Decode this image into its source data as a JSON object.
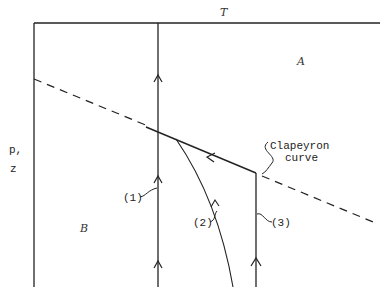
{
  "diagram": {
    "axis_labels": {
      "top": "T",
      "left_line1": "p,",
      "left_line2": "z"
    },
    "regions": {
      "upper": "A",
      "lower": "B"
    },
    "curve_label_line1": "Clapeyron",
    "curve_label_line2": "curve",
    "paths": [
      {
        "id": "1",
        "label": "(1)"
      },
      {
        "id": "2",
        "label": "(2)"
      },
      {
        "id": "3",
        "label": "(3)"
      }
    ],
    "colors": {
      "ink": "#222222",
      "background": "#ffffff"
    }
  }
}
